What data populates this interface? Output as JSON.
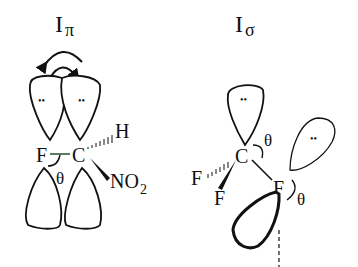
{
  "panels": [
    {
      "title_main": "I",
      "title_sub": "π",
      "atoms": {
        "left": "F",
        "center": "C",
        "up_right": "H",
        "down_right_main": "NO",
        "down_right_sub": "2"
      },
      "angle": "θ",
      "lone_pair": "••"
    },
    {
      "title_main": "I",
      "title_sub": "σ",
      "atoms": {
        "center": "C",
        "hash_left": "F",
        "wedge_down": "F",
        "right": "F"
      },
      "angle_top": "θ",
      "angle_right": "θ",
      "lone_pair": "••"
    }
  ],
  "colors": {
    "ink": "#111111",
    "fc_bond": "#2e5e3e",
    "background": "#ffffff"
  }
}
